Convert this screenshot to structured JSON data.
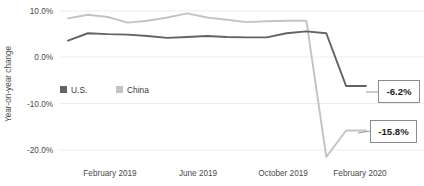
{
  "chart_data": {
    "type": "line",
    "title": "",
    "subtitle": "",
    "xlabel": "",
    "ylabel": "Year-on-year change",
    "ylim": [
      -22.5,
      11.5
    ],
    "yticks": [
      10.0,
      0.0,
      -10.0,
      -20.0
    ],
    "ytick_labels": [
      "10.0%",
      "0.0%",
      "-10.0%",
      "-20.0%"
    ],
    "grid": true,
    "legend_position": "inside-left",
    "x": [
      "February 2019",
      "March 2019",
      "April 2019",
      "May 2019",
      "June 2019",
      "July 2019",
      "August 2019",
      "September 2019",
      "October 2019",
      "November 2019",
      "December 2019",
      "January 2020",
      "February 2020",
      "March 2020",
      "April 2020",
      "May 2020"
    ],
    "xtick_labels": [
      "February 2019",
      "June 2019",
      "October 2019",
      "February 2020"
    ],
    "xtick_indices": [
      0,
      4,
      8,
      12
    ],
    "series": [
      {
        "name": "U.S.",
        "color": "#636363",
        "values": [
          3.6,
          5.2,
          5.0,
          4.9,
          4.6,
          4.2,
          4.4,
          4.6,
          4.4,
          4.3,
          4.3,
          5.2,
          5.6,
          5.2,
          -6.2,
          -6.2
        ]
      },
      {
        "name": "China",
        "color": "#c3c3c3",
        "values": [
          8.4,
          9.2,
          8.7,
          7.5,
          7.9,
          8.6,
          9.5,
          8.6,
          8.1,
          7.6,
          7.8,
          7.9,
          7.9,
          -21.5,
          -15.8,
          -15.8
        ]
      }
    ],
    "annotations": [
      {
        "id": "us-end",
        "label": "-6.2%",
        "series": "U.S.",
        "value": -6.2
      },
      {
        "id": "china-end",
        "label": "-15.8%",
        "series": "China",
        "value": -15.8
      }
    ]
  },
  "legend": {
    "items": [
      {
        "label": "U.S.",
        "color": "#636363",
        "swatch": "square-swatch"
      },
      {
        "label": "China",
        "color": "#c3c3c3",
        "swatch": "square-swatch"
      }
    ]
  },
  "axes": {
    "y_title": "Year-on-year change",
    "y_tick_labels": [
      "10.0%",
      "0.0%",
      "-10.0%",
      "-20.0%"
    ],
    "x_tick_labels": [
      "February 2019",
      "June 2019",
      "October 2019",
      "February 2020"
    ]
  },
  "callouts": {
    "first": "-6.2%",
    "second": "-15.8%"
  },
  "colors": {
    "us": "#636363",
    "china": "#c3c3c3",
    "grid": "#e9e9e9",
    "text": "#4a4a4a",
    "callout_border": "#808080"
  }
}
